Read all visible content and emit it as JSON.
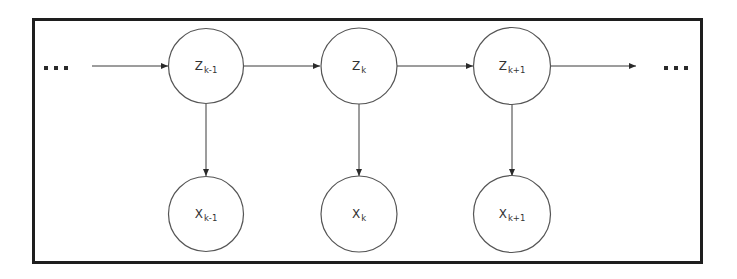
{
  "diagram": {
    "type": "hidden-markov-model",
    "colors": {
      "frame": "#1e1e1e",
      "stroke": "#3a3a3a",
      "text": "#333333",
      "background": "#ffffff"
    },
    "ellipsis_left": "...",
    "ellipsis_right": "...",
    "hidden_states": [
      {
        "id": "z_km1",
        "base": "Z",
        "sub": "k-1",
        "cx": 206,
        "cy": 66
      },
      {
        "id": "z_k",
        "base": "Z",
        "sub": "k",
        "cx": 359,
        "cy": 66
      },
      {
        "id": "z_kp1",
        "base": "Z",
        "sub": "k+1",
        "cx": 512,
        "cy": 66
      }
    ],
    "observations": [
      {
        "id": "x_km1",
        "base": "X",
        "sub": "k-1",
        "cx": 206,
        "cy": 214
      },
      {
        "id": "x_k",
        "base": "X",
        "sub": "k",
        "cx": 359,
        "cy": 214
      },
      {
        "id": "x_kp1",
        "base": "X",
        "sub": "k+1",
        "cx": 512,
        "cy": 214
      }
    ],
    "edges": [
      {
        "from": "ellipsis_left",
        "to": "z_km1"
      },
      {
        "from": "z_km1",
        "to": "z_k"
      },
      {
        "from": "z_k",
        "to": "z_kp1"
      },
      {
        "from": "z_kp1",
        "to": "ellipsis_right"
      },
      {
        "from": "z_km1",
        "to": "x_km1"
      },
      {
        "from": "z_k",
        "to": "x_k"
      },
      {
        "from": "z_kp1",
        "to": "x_kp1"
      }
    ]
  }
}
